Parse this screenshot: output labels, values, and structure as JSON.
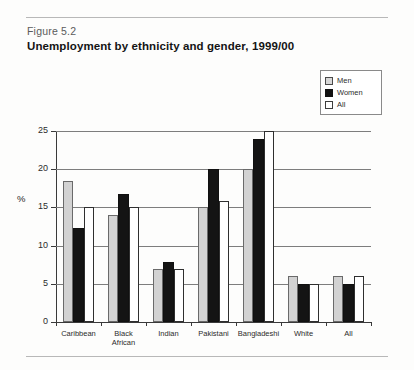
{
  "figure_number": "Figure 5.2",
  "title": "Unemployment by ethnicity and gender, 1999/00",
  "legend": {
    "items": [
      {
        "label": "Men",
        "swatch": "men-swatch",
        "color": "#d2d2d2"
      },
      {
        "label": "Women",
        "swatch": "women-swatch",
        "color": "#141414"
      },
      {
        "label": "All",
        "swatch": "all-swatch",
        "color": "#ffffff"
      }
    ]
  },
  "chart_data": {
    "type": "bar",
    "title": "Unemployment by ethnicity and gender, 1999/00",
    "xlabel": "",
    "ylabel": "%",
    "ylim": [
      0,
      25
    ],
    "yticks": [
      0,
      5,
      10,
      15,
      20,
      25
    ],
    "ytick_labels": [
      "0",
      "5",
      "10",
      "15",
      "20",
      "25"
    ],
    "grid": true,
    "legend_position": "top-right",
    "categories": [
      "Caribbean",
      "Black African",
      "Indian",
      "Pakistani",
      "Bangladeshi",
      "White",
      "All"
    ],
    "category_lines": [
      [
        "Caribbean"
      ],
      [
        "Black",
        "African"
      ],
      [
        "Indian"
      ],
      [
        "Pakistani"
      ],
      [
        "Bangladeshi"
      ],
      [
        "White"
      ],
      [
        "All"
      ]
    ],
    "series": [
      {
        "name": "Men",
        "values": [
          18.5,
          14.0,
          7.0,
          15.0,
          20.0,
          6.0,
          6.0
        ]
      },
      {
        "name": "Women",
        "values": [
          12.3,
          16.8,
          7.8,
          20.0,
          24.0,
          5.0,
          5.0
        ]
      },
      {
        "name": "All",
        "values": [
          15.0,
          15.0,
          7.0,
          15.8,
          25.0,
          5.0,
          6.0
        ]
      }
    ]
  }
}
